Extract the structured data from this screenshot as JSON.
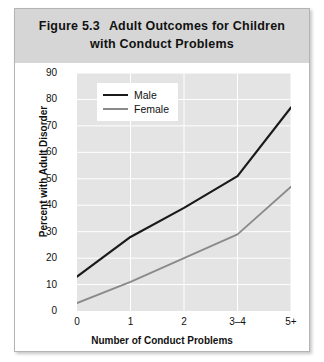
{
  "figure": {
    "number_label": "Figure 5.3",
    "title_line_1": "Adult Outcomes for Children",
    "title_line_2": "with Conduct Problems",
    "title_bar_color": "#d6d6d6",
    "frame_border_color": "#b4b4b4"
  },
  "chart_data": {
    "type": "line",
    "title": "Adult Outcomes for Children with Conduct Problems",
    "xlabel": "Number of Conduct Problems",
    "ylabel": "Percent with Adult Disorder",
    "categories": [
      "0",
      "1",
      "2",
      "3–4",
      "5+"
    ],
    "series": [
      {
        "name": "Male",
        "values": [
          13,
          28,
          39,
          51,
          77
        ],
        "color": "#1a1a1a",
        "width": 2.2
      },
      {
        "name": "Female",
        "values": [
          3,
          11,
          20,
          29,
          47
        ],
        "color": "#8a8a8a",
        "width": 1.8
      }
    ],
    "ylim": [
      0,
      90
    ],
    "yticks": [
      0,
      10,
      20,
      30,
      40,
      50,
      60,
      70,
      80,
      90
    ],
    "ytick_labels": [
      "0",
      "10",
      "20",
      "30",
      "40",
      "50",
      "60",
      "70",
      "80",
      "90"
    ],
    "grid": true,
    "grid_color": "#ffffff",
    "plot_background": "#e4e4e4",
    "legend_position": "top-left",
    "legend_background": "#ffffff"
  }
}
